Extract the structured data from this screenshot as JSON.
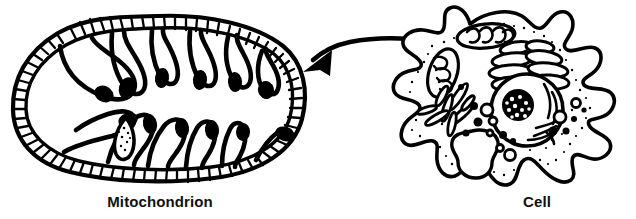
{
  "figure": {
    "background_color": "#ffffff",
    "ink_color": "#000000",
    "width": 636,
    "height": 219
  },
  "labels": {
    "mitochondrion": "Mitochondrion",
    "cell": "Cell"
  },
  "diagrams": {
    "mitochondrion": {
      "name": "Mitochondrion",
      "description": "Cross-section of a mitochondrion showing beaded double membrane and cristae",
      "parts": {
        "outer_membrane": "outer-membrane",
        "inner_membrane": "inner-membrane",
        "cristae": "cristae",
        "matrix": "matrix"
      },
      "crista_count": 12
    },
    "cell": {
      "name": "Cell",
      "description": "Amoeboid animal cell with organelles",
      "organelles": [
        "cell-membrane",
        "mitochondrion",
        "golgi-apparatus",
        "endoplasmic-reticulum",
        "nucleus",
        "nucleolus",
        "vacuole",
        "vesicles",
        "ribosomes"
      ]
    }
  },
  "arrow": {
    "name": "magnification-arrow",
    "direction": "right-to-left",
    "from": "cell-mitochondrion",
    "to": "mitochondrion-diagram"
  }
}
